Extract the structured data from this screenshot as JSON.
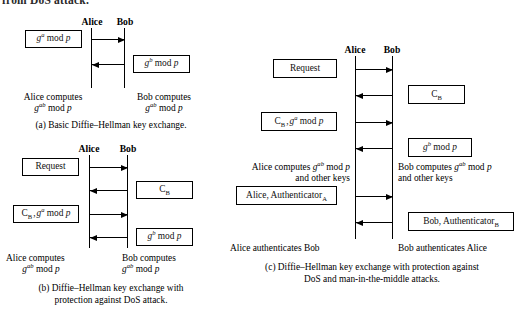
{
  "figure": {
    "running_text_above": "from DoS attack.",
    "panels": [
      {
        "id": "a",
        "caption": [
          "(a)  Basic Diffie–Hellman key exchange."
        ],
        "parties": {
          "left": "Alice",
          "right": "Bob"
        },
        "boxes": [
          {
            "name": "g-a-mod-p",
            "text": "gᵃ mod p",
            "side": "left"
          },
          {
            "name": "g-b-mod-p",
            "text": "gᵇ mod p",
            "side": "right"
          }
        ],
        "arrows": [
          {
            "name": "alice-to-bob-ga",
            "direction": "right"
          },
          {
            "name": "bob-to-alice-gb",
            "direction": "left"
          }
        ],
        "notes": [
          {
            "name": "alice-computes-note",
            "lines": [
              "Alice computes",
              "gᵃᵇ mod p"
            ]
          },
          {
            "name": "bob-computes-note",
            "lines": [
              "Bob computes",
              "gᵃᵇ mod p"
            ]
          }
        ]
      },
      {
        "id": "b",
        "caption": [
          "(b)  Diffie–Hellman key exchange with",
          "protection against DoS attack."
        ],
        "parties": {
          "left": "Alice",
          "right": "Bob"
        },
        "boxes": [
          {
            "name": "request",
            "text": "Request",
            "side": "left"
          },
          {
            "name": "cookie-b",
            "text": "Cʙ",
            "side": "right"
          },
          {
            "name": "cookie-b-and-ga",
            "text": "Cʙ · gᵃ mod p",
            "side": "left"
          },
          {
            "name": "g-b-mod-p",
            "text": "gᵇ mod p",
            "side": "right"
          }
        ],
        "arrows": [
          {
            "name": "alice-to-bob-request",
            "direction": "right"
          },
          {
            "name": "bob-to-alice-cookie",
            "direction": "left"
          },
          {
            "name": "alice-to-bob-cookie-ga",
            "direction": "right"
          },
          {
            "name": "bob-to-alice-gb",
            "direction": "left"
          }
        ],
        "notes": [
          {
            "name": "alice-computes-note",
            "lines": [
              "Alice computes",
              "gᵃᵇ mod p"
            ]
          },
          {
            "name": "bob-computes-note",
            "lines": [
              "Bob computes",
              "gᵃᵇ mod p"
            ]
          }
        ]
      },
      {
        "id": "c",
        "caption": [
          "(c)  Diffie–Hellman key exchange with protection against",
          "DoS and man-in-the-middle attacks."
        ],
        "parties": {
          "left": "Alice",
          "right": "Bob"
        },
        "boxes": [
          {
            "name": "request",
            "text": "Request",
            "side": "left"
          },
          {
            "name": "cookie-b",
            "text": "Cʙ",
            "side": "right"
          },
          {
            "name": "cookie-b-and-ga",
            "text": "Cʙ · gᵃ mod p",
            "side": "left"
          },
          {
            "name": "g-b-mod-p",
            "text": "gᵇ mod p",
            "side": "right"
          },
          {
            "name": "alice-authenticator",
            "text": "Alice, Authenticatorᴀ",
            "side": "left"
          },
          {
            "name": "bob-authenticator",
            "text": "Bob, Authenticatorʙ",
            "side": "right"
          }
        ],
        "arrows": [
          {
            "name": "alice-to-bob-request",
            "direction": "right"
          },
          {
            "name": "bob-to-alice-cookie",
            "direction": "left"
          },
          {
            "name": "alice-to-bob-cookie-ga",
            "direction": "right"
          },
          {
            "name": "bob-to-alice-gb",
            "direction": "left"
          },
          {
            "name": "alice-to-bob-authenticator",
            "direction": "right"
          },
          {
            "name": "bob-to-alice-authenticator",
            "direction": "left"
          }
        ],
        "notes": [
          {
            "name": "alice-computes-note",
            "lines": [
              "Alice computes gᵃᵇ mod p",
              "and other keys"
            ]
          },
          {
            "name": "bob-computes-note",
            "lines": [
              "Bob computes gᵃᵇ mod p",
              "and other keys"
            ]
          },
          {
            "name": "alice-authenticates-bob-note",
            "lines": [
              "Alice authenticates Bob"
            ]
          },
          {
            "name": "bob-authenticates-alice-note",
            "lines": [
              "Bob authenticates Alice"
            ]
          }
        ]
      }
    ]
  },
  "colors": {
    "ink": "#000000",
    "paper": "#ffffff"
  }
}
